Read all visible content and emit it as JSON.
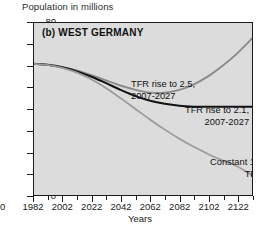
{
  "axis": {
    "y_title": "Population in millions",
    "x_title": "Years",
    "y_ticks": [
      "80",
      "70",
      "60",
      "50",
      "40",
      "30",
      "20",
      "10",
      "0"
    ],
    "x_ticks": [
      "1982",
      "2002",
      "2022",
      "2042",
      "2062",
      "2082",
      "2102",
      "2122"
    ],
    "orphan_left_label": "0"
  },
  "panel": {
    "label": "(b)  WEST GERMANY"
  },
  "annotations": {
    "tfr25_line1": "TFR rise to 2.5,",
    "tfr25_line2": "2007-2027",
    "tfr21_line1": "TFR rise to 2.1,",
    "tfr21_line2": "2007-2027",
    "tfr13_line1": "Constant 1.3",
    "tfr13_line2": "TFR"
  },
  "colors": {
    "plot_background": "#dcdcdc",
    "axis": "#1a1a1a",
    "series_tfr25": "#8a8a8a",
    "series_tfr21": "#111111",
    "series_tfr13": "#9a9a9a"
  },
  "chart_data": {
    "type": "line",
    "title": "(b)  WEST GERMANY",
    "subtitle": "Population in millions",
    "xlabel": "Years",
    "ylabel": "Population in millions",
    "xlim": [
      1982,
      2132
    ],
    "ylim": [
      0,
      80
    ],
    "x_major_ticks": [
      1982,
      2002,
      2022,
      2042,
      2062,
      2082,
      2102,
      2122
    ],
    "y_major_ticks": [
      0,
      10,
      20,
      30,
      40,
      50,
      60,
      70,
      80
    ],
    "minor_tick_step_x": 10,
    "grid": false,
    "legend": "inline-annotations",
    "x": [
      1982,
      1992,
      2002,
      2012,
      2022,
      2032,
      2042,
      2052,
      2062,
      2072,
      2082,
      2092,
      2102,
      2112,
      2122,
      2132
    ],
    "series": [
      {
        "name": "TFR rise to 2.5, 2007-2027",
        "color": "#8a8a8a",
        "values": [
          61.0,
          60.6,
          59.5,
          57.8,
          55.6,
          53.2,
          50.8,
          48.9,
          47.6,
          47.6,
          48.9,
          51.5,
          55.3,
          60.2,
          66.0,
          72.8
        ]
      },
      {
        "name": "TFR rise to 2.1, 2007-2027",
        "color": "#111111",
        "values": [
          61.0,
          60.5,
          59.3,
          57.4,
          54.9,
          51.9,
          48.8,
          46.0,
          43.8,
          42.4,
          41.5,
          41.1,
          41.0,
          41.0,
          41.0,
          41.0
        ]
      },
      {
        "name": "Constant 1.3 TFR",
        "color": "#9a9a9a",
        "values": [
          61.0,
          60.4,
          59.0,
          56.8,
          53.6,
          49.5,
          44.8,
          39.9,
          35.0,
          30.4,
          26.2,
          22.4,
          19.0,
          16.0,
          13.3,
          9.2
        ]
      }
    ],
    "annotations": [
      {
        "text": "TFR rise to 2.5, 2007-2027",
        "series": "TFR rise to 2.5, 2007-2027"
      },
      {
        "text": "TFR rise to 2.1, 2007-2027",
        "series": "TFR rise to 2.1, 2007-2027"
      },
      {
        "text": "Constant 1.3 TFR",
        "series": "Constant 1.3 TFR"
      }
    ]
  }
}
